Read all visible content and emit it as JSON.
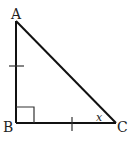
{
  "figure": {
    "type": "right-triangle",
    "stroke_color": "#111111",
    "background": "#ffffff",
    "vertices": [
      {
        "name": "A",
        "x": 16,
        "y": 21
      },
      {
        "name": "B",
        "x": 16,
        "y": 123
      },
      {
        "name": "C",
        "x": 116,
        "y": 123
      }
    ],
    "labels": {
      "A": "A",
      "B": "B",
      "C": "C",
      "angle_C": "x"
    },
    "right_angle_at": "B",
    "congruent_sides": [
      "AB",
      "BC"
    ]
  }
}
